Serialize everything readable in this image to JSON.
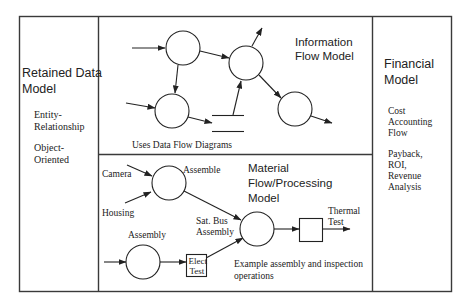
{
  "panels": {
    "retained_data": {
      "title_line1": "Retained Data",
      "title_line2": "Model",
      "items": [
        {
          "line1": "Entity-",
          "line2": "Relationship"
        },
        {
          "line1": "Object-",
          "line2": "Oriented"
        }
      ]
    },
    "information_flow": {
      "title_line1": "Information",
      "title_line2": "Flow Model",
      "caption": "Uses Data Flow Diagrams"
    },
    "material_flow": {
      "title_line1": "Material",
      "title_line2": "Flow/Processing",
      "title_line3": "Model",
      "labels": {
        "camera": "Camera",
        "housing": "Housing",
        "assemble": "Assemble",
        "assembly": "Assembly",
        "sat_bus_line1": "Sat. Bus",
        "sat_bus_line2": "Assembly",
        "elect_line1": "Elect",
        "elect_line2": "Test",
        "thermal_line1": "Thermal",
        "thermal_line2": "Test"
      },
      "caption_line1": "Example assembly and inspection",
      "caption_line2": "operations"
    },
    "financial": {
      "title_line1": "Financial",
      "title_line2": "Model",
      "item1": [
        "Cost",
        "Accounting",
        "Flow"
      ],
      "item2": [
        "Payback,",
        "ROI,",
        "Revenue",
        "Analysis"
      ]
    }
  },
  "colors": {
    "stroke": "#222222",
    "frame": "#3a3a3a",
    "background": "#ffffff"
  }
}
